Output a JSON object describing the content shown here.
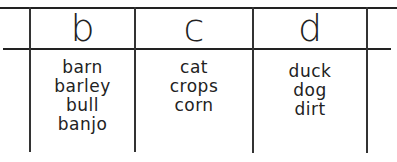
{
  "table": {
    "headers": [
      "b",
      "c",
      "d"
    ],
    "columns": [
      {
        "letter": "b",
        "words": [
          "barn",
          "barley",
          "bull",
          "banjo"
        ]
      },
      {
        "letter": "c",
        "words": [
          "cat",
          "crops",
          "corn"
        ]
      },
      {
        "letter": "d",
        "words": [
          "duck",
          "dog",
          "dirt"
        ]
      }
    ]
  }
}
